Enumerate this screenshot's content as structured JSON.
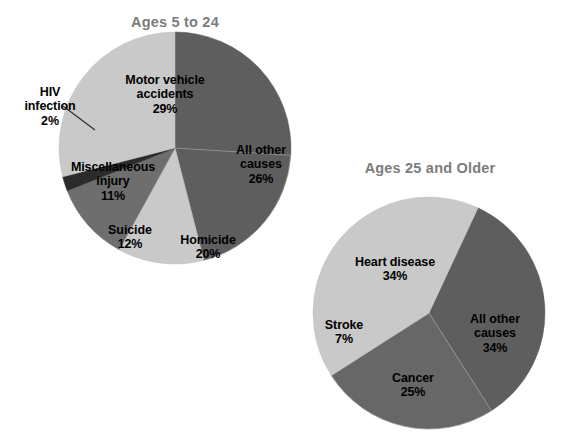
{
  "chart_data": [
    {
      "type": "pie",
      "title": "Ages 5 to 24",
      "categories": [
        "Motor vehicle accidents",
        "All other causes",
        "Homicide",
        "Suicide",
        "Miscellaneous injury",
        "HIV infection"
      ],
      "values": [
        29,
        26,
        20,
        12,
        11,
        2
      ],
      "value_suffix": "%",
      "labels": [
        {
          "name": "Motor vehicle accidents",
          "pct": "29%",
          "color": "#c9c9c9"
        },
        {
          "name": "All other causes",
          "pct": "26%",
          "color": "#5e5e5e"
        },
        {
          "name": "Homicide",
          "pct": "20%",
          "color": "#5e5e5e"
        },
        {
          "name": "Suicide",
          "pct": "12%",
          "color": "#c9c9c9"
        },
        {
          "name": "Miscellaneous injury",
          "pct": "11%",
          "color": "#6e6e6e"
        },
        {
          "name": "HIV infection",
          "pct": "2%",
          "color": "#2b2b2b"
        }
      ],
      "xlabel": "",
      "ylabel": "",
      "legend": "none",
      "grid": false
    },
    {
      "type": "pie",
      "title": "Ages 25 and Older",
      "categories": [
        "Heart disease",
        "All other causes",
        "Cancer",
        "Stroke"
      ],
      "values": [
        34,
        34,
        25,
        7
      ],
      "value_suffix": "%",
      "labels": [
        {
          "name": "Heart disease",
          "pct": "34%",
          "color": "#c9c9c9"
        },
        {
          "name": "All other causes",
          "pct": "34%",
          "color": "#5e5e5e"
        },
        {
          "name": "Cancer",
          "pct": "25%",
          "color": "#676767"
        },
        {
          "name": "Stroke",
          "pct": "7%",
          "color": "#c9c9c9"
        }
      ],
      "xlabel": "",
      "ylabel": "",
      "legend": "none",
      "grid": false
    }
  ],
  "left_chart": {
    "title": "Ages 5 to 24",
    "motor_vehicle": {
      "name": "Motor vehicle\naccidents",
      "pct": "29%"
    },
    "all_other": {
      "name": "All other\ncauses",
      "pct": "26%"
    },
    "homicide": {
      "name": "Homicide",
      "pct": "20%"
    },
    "suicide": {
      "name": "Suicide",
      "pct": "12%"
    },
    "miscellaneous": {
      "name": "Miscellaneous\ninjury",
      "pct": "11%"
    },
    "hiv": {
      "name": "HIV\ninfection",
      "pct": "2%"
    }
  },
  "right_chart": {
    "title": "Ages 25 and Older",
    "heart_disease": {
      "name": "Heart disease",
      "pct": "34%"
    },
    "all_other": {
      "name": "All other\ncauses",
      "pct": "34%"
    },
    "cancer": {
      "name": "Cancer",
      "pct": "25%"
    },
    "stroke": {
      "name": "Stroke",
      "pct": "7%"
    }
  },
  "colors": {
    "light_gray": "#c9c9c9",
    "medium_gray": "#6e6e6e",
    "dark_gray": "#5e5e5e",
    "near_black": "#2b2b2b",
    "title_gray": "#7c7c7c",
    "background": "#ffffff"
  }
}
